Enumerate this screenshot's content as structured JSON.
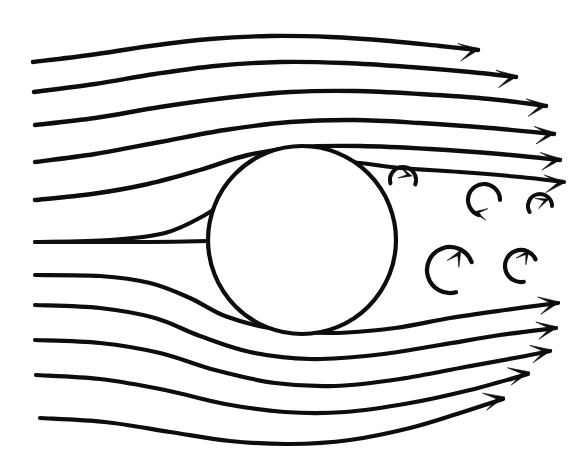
{
  "figure": {
    "background_color": "#ffffff",
    "ink_color": "#0d0d0d",
    "canvas": {
      "width": 581,
      "height": 466
    }
  },
  "chart_data": {
    "type": "line",
    "subtitle": "",
    "xlabel": "",
    "ylabel": "",
    "xlim": [
      0,
      581
    ],
    "ylim": [
      0,
      466
    ],
    "grid": false,
    "legend": "none",
    "annotations": [],
    "body": {
      "name": "cylinder",
      "shape": "circle",
      "cx": 302,
      "cy": 240,
      "r": 94,
      "stroke_width": 4.2,
      "fill": "#ffffff"
    },
    "stream_direction": "left-to-right",
    "streamline_count": 11,
    "vortex_count": 5,
    "series": [
      {
        "name": "streamline-1",
        "stroke_width": 4.4,
        "has_arrow": true,
        "arrow_at": [
          480,
          49
        ],
        "arrow_angle": -9,
        "points": [
          [
            33,
            62
          ],
          [
            90,
            55
          ],
          [
            150,
            46
          ],
          [
            210,
            39
          ],
          [
            270,
            36
          ],
          [
            330,
            37
          ],
          [
            390,
            41
          ],
          [
            440,
            46
          ],
          [
            478,
            50
          ]
        ]
      },
      {
        "name": "streamline-2",
        "stroke_width": 4.4,
        "has_arrow": true,
        "arrow_at": [
          518,
          76
        ],
        "arrow_angle": -8,
        "points": [
          [
            34,
            92
          ],
          [
            95,
            84
          ],
          [
            155,
            74
          ],
          [
            215,
            66
          ],
          [
            280,
            62
          ],
          [
            345,
            63
          ],
          [
            410,
            67
          ],
          [
            470,
            72
          ],
          [
            516,
            77
          ]
        ]
      },
      {
        "name": "streamline-3",
        "stroke_width": 4.4,
        "has_arrow": true,
        "arrow_at": [
          548,
          105
        ],
        "arrow_angle": -7,
        "points": [
          [
            35,
            125
          ],
          [
            95,
            118
          ],
          [
            160,
            107
          ],
          [
            225,
            98
          ],
          [
            290,
            92
          ],
          [
            355,
            91
          ],
          [
            420,
            94
          ],
          [
            490,
            99
          ],
          [
            546,
            106
          ]
        ]
      },
      {
        "name": "streamline-4",
        "stroke_width": 4.4,
        "has_arrow": true,
        "arrow_at": [
          556,
          133
        ],
        "arrow_angle": -6,
        "points": [
          [
            35,
            162
          ],
          [
            95,
            154
          ],
          [
            160,
            142
          ],
          [
            225,
            130
          ],
          [
            290,
            122
          ],
          [
            355,
            120
          ],
          [
            420,
            123
          ],
          [
            490,
            128
          ],
          [
            554,
            134
          ]
        ]
      },
      {
        "name": "streamline-5",
        "stroke_width": 4.4,
        "has_arrow": true,
        "arrow_at": [
          562,
          159
        ],
        "arrow_angle": -6,
        "points": [
          [
            35,
            200
          ],
          [
            92,
            194
          ],
          [
            148,
            184
          ],
          [
            200,
            170
          ],
          [
            248,
            155
          ],
          [
            300,
            147
          ],
          [
            360,
            146
          ],
          [
            430,
            149
          ],
          [
            500,
            154
          ],
          [
            560,
            160
          ]
        ]
      },
      {
        "name": "streamline-6",
        "stroke_width": 4.0,
        "has_arrow": true,
        "arrow_at": [
          566,
          182
        ],
        "arrow_angle": -5,
        "points": [
          [
            35,
            242
          ],
          [
            110,
            240
          ],
          [
            165,
            233
          ],
          [
            205,
            215
          ],
          [
            240,
            192
          ],
          [
            285,
            172
          ],
          [
            340,
            162
          ],
          [
            400,
            168
          ],
          [
            460,
            172
          ],
          [
            520,
            177
          ],
          [
            564,
            182
          ]
        ]
      },
      {
        "name": "streamline-7-stagnation",
        "stroke_width": 4.0,
        "has_arrow": false,
        "arrow_at": null,
        "arrow_angle": 0,
        "points": [
          [
            35,
            242
          ],
          [
            100,
            242
          ],
          [
            150,
            242
          ],
          [
            208,
            241
          ]
        ]
      },
      {
        "name": "streamline-8",
        "stroke_width": 4.2,
        "has_arrow": true,
        "arrow_at": [
          560,
          302
        ],
        "arrow_angle": -10,
        "points": [
          [
            35,
            275
          ],
          [
            100,
            276
          ],
          [
            150,
            283
          ],
          [
            190,
            298
          ],
          [
            225,
            316
          ],
          [
            270,
            328
          ],
          [
            330,
            333
          ],
          [
            395,
            328
          ],
          [
            450,
            318
          ],
          [
            505,
            310
          ],
          [
            558,
            303
          ]
        ]
      },
      {
        "name": "streamline-9",
        "stroke_width": 4.2,
        "has_arrow": true,
        "arrow_at": [
          558,
          327
        ],
        "arrow_angle": -10,
        "points": [
          [
            35,
            305
          ],
          [
            100,
            308
          ],
          [
            155,
            318
          ],
          [
            200,
            336
          ],
          [
            250,
            352
          ],
          [
            310,
            359
          ],
          [
            375,
            355
          ],
          [
            440,
            345
          ],
          [
            500,
            335
          ],
          [
            556,
            328
          ]
        ]
      },
      {
        "name": "streamline-10",
        "stroke_width": 4.2,
        "has_arrow": true,
        "arrow_at": [
          552,
          350
        ],
        "arrow_angle": -11,
        "points": [
          [
            35,
            340
          ],
          [
            100,
            343
          ],
          [
            160,
            353
          ],
          [
            215,
            370
          ],
          [
            275,
            383
          ],
          [
            335,
            386
          ],
          [
            400,
            379
          ],
          [
            465,
            367
          ],
          [
            520,
            357
          ],
          [
            550,
            351
          ]
        ]
      },
      {
        "name": "streamline-11",
        "stroke_width": 4.2,
        "has_arrow": true,
        "arrow_at": [
          530,
          372
        ],
        "arrow_angle": -12,
        "points": [
          [
            36,
            375
          ],
          [
            100,
            379
          ],
          [
            165,
            390
          ],
          [
            225,
            404
          ],
          [
            285,
            412
          ],
          [
            345,
            412
          ],
          [
            410,
            403
          ],
          [
            470,
            390
          ],
          [
            528,
            374
          ]
        ]
      },
      {
        "name": "streamline-12",
        "stroke_width": 4.2,
        "has_arrow": true,
        "arrow_at": [
          505,
          397
        ],
        "arrow_angle": -13,
        "points": [
          [
            40,
            418
          ],
          [
            105,
            422
          ],
          [
            170,
            432
          ],
          [
            230,
            441
          ],
          [
            290,
            444
          ],
          [
            350,
            440
          ],
          [
            410,
            428
          ],
          [
            460,
            413
          ],
          [
            503,
            399
          ]
        ]
      }
    ],
    "vortices": [
      {
        "name": "vortex-1",
        "cx": 403,
        "cy": 180,
        "r": 13,
        "rotation": "clockwise",
        "stroke_width": 4.0,
        "arc_start_deg": 165,
        "arc_sweep_deg": 215,
        "arrow_at": [
          412,
          176
        ],
        "arrow_angle": 15,
        "arrow_size": 13
      },
      {
        "name": "vortex-2",
        "cx": 484,
        "cy": 200,
        "r": 16,
        "rotation": "clockwise",
        "stroke_width": 4.2,
        "arc_start_deg": 110,
        "arc_sweep_deg": 250,
        "arrow_at": [
          473,
          212
        ],
        "arrow_angle": 190,
        "arrow_size": 14
      },
      {
        "name": "vortex-3",
        "cx": 540,
        "cy": 206,
        "r": 12,
        "rotation": "clockwise",
        "stroke_width": 4.0,
        "arc_start_deg": 150,
        "arc_sweep_deg": 210,
        "arrow_at": [
          549,
          199
        ],
        "arrow_angle": 340,
        "arrow_size": 13
      },
      {
        "name": "vortex-4",
        "cx": 450,
        "cy": 270,
        "r": 23,
        "rotation": "counter-clockwise",
        "stroke_width": 4.3,
        "arc_start_deg": 75,
        "arc_sweep_deg": 265,
        "arrow_at": [
          461,
          250
        ],
        "arrow_angle": 300,
        "arrow_size": 16
      },
      {
        "name": "vortex-5",
        "cx": 521,
        "cy": 266,
        "r": 16,
        "rotation": "counter-clockwise",
        "stroke_width": 4.2,
        "arc_start_deg": 80,
        "arc_sweep_deg": 255,
        "arrow_at": [
          529,
          250
        ],
        "arrow_angle": 305,
        "arrow_size": 14
      }
    ]
  }
}
